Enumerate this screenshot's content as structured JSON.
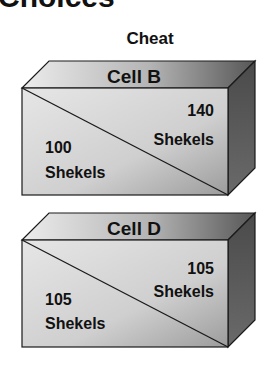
{
  "title": "Choices",
  "column_label": "Cheat",
  "boxes": [
    {
      "label": "Cell B",
      "upper_right": {
        "amount": "140",
        "unit": "Shekels"
      },
      "lower_left": {
        "amount": "100",
        "unit": "Shekels"
      }
    },
    {
      "label": "Cell D",
      "upper_right": {
        "amount": "105",
        "unit": "Shekels"
      },
      "lower_left": {
        "amount": "105",
        "unit": "Shekels"
      }
    }
  ],
  "colors": {
    "front_light": "#e4e4e4",
    "front_dark": "#9a9a9a",
    "top_light": "#e8e8e8",
    "top_dark": "#5c5c5c",
    "side": "#505050",
    "outline": "#1a1a1a"
  }
}
